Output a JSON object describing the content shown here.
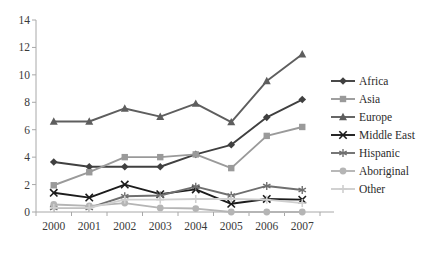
{
  "chart_data": {
    "type": "line",
    "title": "",
    "xlabel": "",
    "ylabel": "",
    "categories": [
      "2000",
      "2001",
      "2002",
      "2003",
      "2004",
      "2005",
      "2006",
      "2007"
    ],
    "ylim": [
      0,
      14
    ],
    "yticks": [
      0,
      2,
      4,
      6,
      8,
      10,
      12,
      14
    ],
    "grid": false,
    "legend_position": "right",
    "series": [
      {
        "name": "Africa",
        "marker": "diamond",
        "color": "#404040",
        "values": [
          3.65,
          3.3,
          3.3,
          3.3,
          4.2,
          4.9,
          6.9,
          8.2
        ]
      },
      {
        "name": "Asia",
        "marker": "square",
        "color": "#9a9a9a",
        "values": [
          1.95,
          2.9,
          4.0,
          4.0,
          4.2,
          3.2,
          5.55,
          6.2
        ]
      },
      {
        "name": "Europe",
        "marker": "triangle",
        "color": "#5e5e5e",
        "values": [
          6.6,
          6.6,
          7.55,
          6.95,
          7.9,
          6.55,
          9.55,
          11.5
        ]
      },
      {
        "name": "Middle East",
        "marker": "x",
        "color": "#1c1c1c",
        "values": [
          1.4,
          1.05,
          2.0,
          1.3,
          1.65,
          0.6,
          0.95,
          0.9
        ]
      },
      {
        "name": "Hispanic",
        "marker": "asterisk",
        "color": "#6f6f6f",
        "values": [
          0.3,
          0.3,
          1.15,
          1.2,
          1.85,
          1.2,
          1.9,
          1.6
        ]
      },
      {
        "name": "Aboriginal",
        "marker": "circle",
        "color": "#b5b5b5",
        "values": [
          0.55,
          0.45,
          0.65,
          0.3,
          0.25,
          0.0,
          0.0,
          0.0
        ]
      },
      {
        "name": "Other",
        "marker": "plus",
        "color": "#cfcfcf",
        "values": [
          0.3,
          0.3,
          0.9,
          0.9,
          0.95,
          0.95,
          0.9,
          0.65
        ]
      }
    ]
  }
}
